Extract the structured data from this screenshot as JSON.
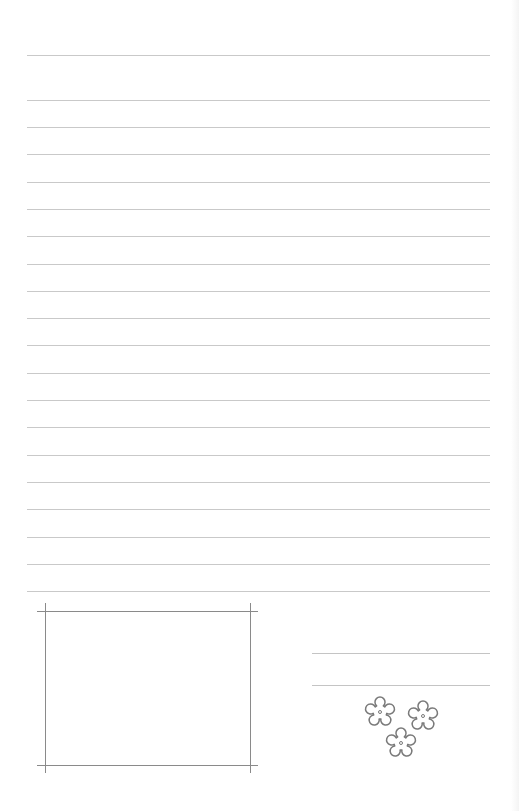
{
  "page": {
    "type": "lined-letter-paper",
    "background": "#ffffff",
    "rule_color": "#c9c9c9",
    "frame_color": "#8a8a8a"
  },
  "ruled_lines": [
    55,
    100,
    127,
    154,
    182,
    209,
    236,
    264,
    291,
    318,
    345,
    373,
    400,
    427,
    455,
    482,
    509,
    537,
    564,
    591
  ],
  "photo_frame": {
    "left": 45,
    "top": 611,
    "right": 250,
    "bottom": 765,
    "overhang": 8
  },
  "signature_lines": [
    653,
    685
  ],
  "decoration": {
    "icon": "flower-cluster-icon",
    "flowers": [
      {
        "cx": 25,
        "cy": 22
      },
      {
        "cx": 68,
        "cy": 26
      },
      {
        "cx": 46,
        "cy": 53
      }
    ]
  }
}
